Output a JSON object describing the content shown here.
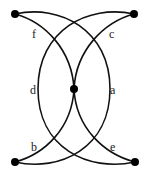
{
  "diagram": {
    "nodes": [
      {
        "id": "top-left",
        "x": 15,
        "y": 14
      },
      {
        "id": "top-right",
        "x": 134,
        "y": 14
      },
      {
        "id": "center",
        "x": 74,
        "y": 89
      },
      {
        "id": "bottom-left",
        "x": 15,
        "y": 162
      },
      {
        "id": "bottom-right",
        "x": 135,
        "y": 162
      }
    ],
    "edges": [
      {
        "label": "a",
        "from": "top-left",
        "to": "bottom-left",
        "label_x": 112,
        "label_y": 93
      },
      {
        "label": "b",
        "from": "bottom-left",
        "to": "center",
        "label_x": 33,
        "label_y": 150
      },
      {
        "label": "c",
        "from": "top-right",
        "to": "center",
        "label_x": 110,
        "label_y": 37
      },
      {
        "label": "d",
        "from": "top-right",
        "to": "bottom-right",
        "label_x": 32,
        "label_y": 93
      },
      {
        "label": "e",
        "from": "bottom-right",
        "to": "center",
        "label_x": 111,
        "label_y": 150
      },
      {
        "label": "f",
        "from": "top-left",
        "to": "center",
        "label_x": 34,
        "label_y": 37
      }
    ],
    "colors": {
      "stroke": "#111111",
      "node": "#000000",
      "background": "#ffffff"
    }
  }
}
